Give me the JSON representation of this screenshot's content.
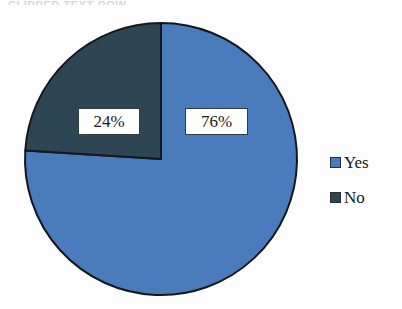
{
  "heading": {
    "clipped_text": "CLIPPED TEXT ROW"
  },
  "chart_data": {
    "type": "pie",
    "title": "",
    "categories": [
      "Yes",
      "No"
    ],
    "values": [
      76,
      24
    ],
    "value_unit": "%",
    "data_labels": [
      "76%",
      "24%"
    ],
    "colors": [
      "#4a7cbd",
      "#2e4553"
    ],
    "slice_border_color": "#14181c",
    "start_angle_deg": 0,
    "direction": "clockwise",
    "legend_position": "right",
    "grid": false,
    "series": [
      {
        "name": "Responses",
        "values": [
          76,
          24
        ]
      }
    ]
  },
  "labels": {
    "yes_pct": "76%",
    "no_pct": "24%"
  },
  "legend": {
    "items": [
      {
        "label": "Yes",
        "color": "#4a7cbd",
        "swatch_name": "legend-swatch-yes"
      },
      {
        "label": "No",
        "color": "#2e4553",
        "swatch_name": "legend-swatch-no"
      }
    ]
  },
  "geometry": {
    "center_x": 161,
    "center_y": 159,
    "radius": 136
  }
}
